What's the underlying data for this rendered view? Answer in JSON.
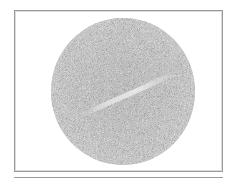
{
  "figure": {
    "colors": {
      "frame": "#9a9a9a",
      "disc_center": "#8e8e8e",
      "disc_edge": "#c8c8c8",
      "background": "#ffffff"
    }
  }
}
